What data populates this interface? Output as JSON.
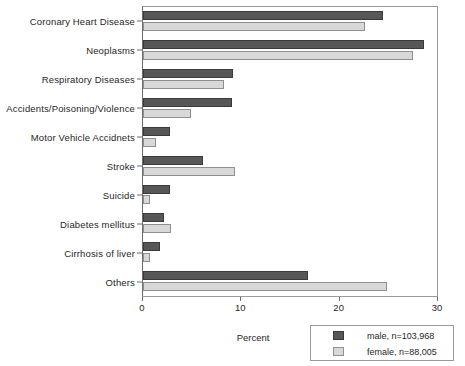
{
  "chart_data": {
    "type": "bar",
    "orientation": "horizontal",
    "title": "",
    "xlabel": "Percent",
    "ylabel": "",
    "xlim": [
      0,
      30
    ],
    "xticks": [
      0,
      10,
      20,
      30
    ],
    "grid": false,
    "legend_position": "bottom-right",
    "categories": [
      "Coronary Heart Disease",
      "Neoplasms",
      "Respiratory Diseases",
      "Accidents/Poisoning/Violence",
      "Motor Vehicle Accidnets",
      "Stroke",
      "Suicide",
      "Diabetes mellitus",
      "Cirrhosis of liver",
      "Others"
    ],
    "series": [
      {
        "name": "male, n=103,968",
        "key": "male",
        "color": "#575757",
        "values": [
          24.4,
          28.6,
          9.2,
          9.1,
          2.7,
          6.1,
          2.7,
          2.1,
          1.7,
          16.8
        ]
      },
      {
        "name": "female, n=88,005",
        "key": "female",
        "color": "#d8d8d8",
        "values": [
          22.6,
          27.5,
          8.2,
          4.9,
          1.3,
          9.4,
          0.7,
          2.8,
          0.7,
          24.8
        ]
      }
    ]
  }
}
